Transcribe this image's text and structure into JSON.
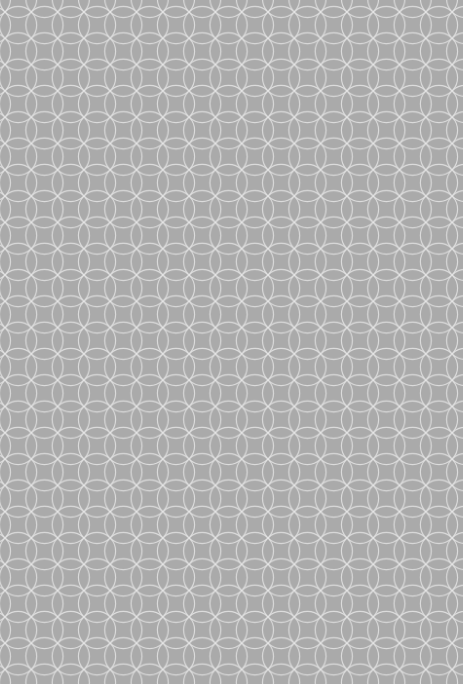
{
  "pattern": {
    "name": "interlocking-circles",
    "background_color": "#aaaaaa",
    "stroke_color": "#e6e6e6",
    "period_px": 26.3,
    "offset_x": 5,
    "offset_y": 12
  }
}
